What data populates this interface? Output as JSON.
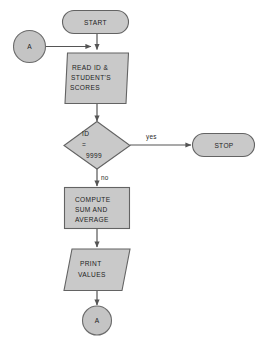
{
  "diagram": {
    "type": "flowchart",
    "colors": {
      "shape_fill": "#c9c9c9",
      "shape_border": "#636363",
      "line": "#555555",
      "text": "#1d1d1d",
      "background": "#ffffff"
    },
    "nodes": {
      "start": {
        "shape": "terminator",
        "label": "START"
      },
      "connector_in": {
        "shape": "connector-circle",
        "label": "A"
      },
      "read_input": {
        "shape": "parallelogram",
        "lines": [
          "READ ID &",
          "STUDENT'S",
          "SCORES"
        ]
      },
      "decision": {
        "shape": "diamond",
        "lines": [
          "ID",
          "=",
          "9999"
        ]
      },
      "stop": {
        "shape": "terminator",
        "label": "STOP"
      },
      "compute": {
        "shape": "rectangle",
        "lines": [
          "COMPUTE",
          "SUM AND",
          "AVERAGE"
        ]
      },
      "print_output": {
        "shape": "parallelogram",
        "lines": [
          "PRINT",
          "VALUES"
        ]
      },
      "connector_out": {
        "shape": "connector-circle",
        "label": "A"
      }
    },
    "edges": {
      "yes_label": "yes",
      "no_label": "no"
    }
  }
}
